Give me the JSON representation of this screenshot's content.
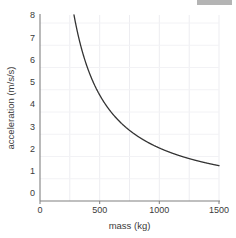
{
  "figure": {
    "background_color": "#ffffff",
    "artifact": {
      "name": "scrollbar-artifact",
      "color": "#b4b4b4"
    }
  },
  "chart_data": {
    "type": "line",
    "title": "",
    "subtitle": "",
    "xlabel": "mass (kg)",
    "ylabel": "acceleration (m/s/s)",
    "xlim": [
      0,
      1500
    ],
    "ylim": [
      0,
      8
    ],
    "xticks": [
      0,
      500,
      1000,
      1500
    ],
    "xtick_labels": [
      "0",
      "500",
      "1000",
      "1500"
    ],
    "yticks": [
      0,
      1,
      2,
      3,
      4,
      5,
      6,
      7,
      8
    ],
    "ytick_labels": [
      "0",
      "1",
      "2",
      "3",
      "4",
      "5",
      "6",
      "7",
      "8"
    ],
    "grid": true,
    "grid_color": "#e8e8ec",
    "legend": false,
    "legend_position": "none",
    "relationship": "inverse proportional: acceleration = 2280 / mass",
    "constant_force_N": 2280,
    "line_color": "#333333",
    "line_width": 1.3,
    "series": [
      {
        "name": "acceleration vs mass",
        "x": [
          285,
          300,
          325,
          350,
          375,
          400,
          425,
          450,
          475,
          500,
          550,
          600,
          650,
          700,
          750,
          800,
          850,
          900,
          950,
          1000,
          1050,
          1100,
          1150,
          1200,
          1250,
          1300,
          1350,
          1400,
          1450,
          1500
        ],
        "values": [
          8.0,
          7.6,
          7.02,
          6.51,
          6.08,
          5.7,
          5.36,
          5.07,
          4.8,
          4.56,
          4.15,
          3.8,
          3.51,
          3.26,
          3.04,
          2.85,
          2.68,
          2.53,
          2.4,
          2.28,
          2.17,
          2.07,
          1.98,
          1.9,
          1.82,
          1.75,
          1.69,
          1.63,
          1.57,
          1.52
        ]
      }
    ],
    "annotations": []
  },
  "axes": {
    "x_axis_name": "x-axis",
    "y_axis_name": "y-axis",
    "axis_color": "#808080"
  }
}
